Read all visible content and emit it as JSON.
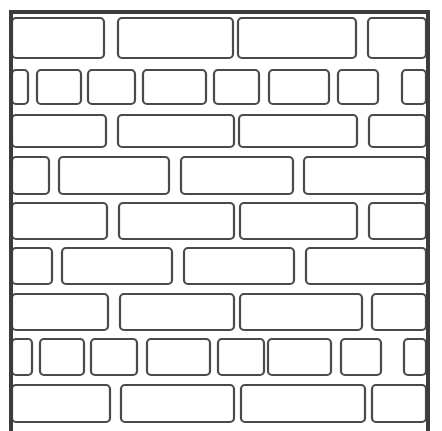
{
  "colors": {
    "background": "#ffffff",
    "outline": "#4a4a4a",
    "frame": "#3c3c3c"
  },
  "frame": {
    "left": 11,
    "top": 12,
    "right": 428,
    "bottom": 431
  },
  "rows": [
    {
      "name": "row-1",
      "y": 18,
      "h": 40,
      "bricks": [
        [
          12,
          92
        ],
        [
          118,
          115
        ],
        [
          238,
          118
        ],
        [
          368,
          58
        ]
      ]
    },
    {
      "name": "row-2",
      "y": 70,
      "h": 34,
      "bricks": [
        [
          12,
          16
        ],
        [
          37,
          44
        ],
        [
          88,
          47
        ],
        [
          143,
          63
        ],
        [
          214,
          45
        ],
        [
          269,
          60
        ],
        [
          338,
          40
        ],
        [
          402,
          24
        ]
      ]
    },
    {
      "name": "row-3",
      "y": 115,
      "h": 32,
      "bricks": [
        [
          12,
          94
        ],
        [
          118,
          116
        ],
        [
          239,
          118
        ],
        [
          369,
          57
        ]
      ]
    },
    {
      "name": "row-4",
      "y": 157,
      "h": 37,
      "bricks": [
        [
          12,
          37
        ],
        [
          59,
          110
        ],
        [
          181,
          112
        ],
        [
          304,
          122
        ]
      ]
    },
    {
      "name": "row-5",
      "y": 203,
      "h": 36,
      "bricks": [
        [
          12,
          95
        ],
        [
          119,
          115
        ],
        [
          240,
          117
        ],
        [
          369,
          57
        ]
      ]
    },
    {
      "name": "row-6",
      "y": 248,
      "h": 36,
      "bricks": [
        [
          12,
          40
        ],
        [
          62,
          110
        ],
        [
          184,
          110
        ],
        [
          306,
          120
        ]
      ]
    },
    {
      "name": "row-7",
      "y": 294,
      "h": 36,
      "bricks": [
        [
          12,
          96
        ],
        [
          120,
          114
        ],
        [
          240,
          122
        ],
        [
          372,
          54
        ]
      ]
    },
    {
      "name": "row-8",
      "y": 339,
      "h": 36,
      "bricks": [
        [
          12,
          20
        ],
        [
          40,
          44
        ],
        [
          91,
          46
        ],
        [
          147,
          63
        ],
        [
          218,
          46
        ],
        [
          268,
          63
        ],
        [
          341,
          40
        ],
        [
          404,
          22
        ]
      ]
    },
    {
      "name": "row-9",
      "y": 385,
      "h": 37,
      "bricks": [
        [
          12,
          98
        ],
        [
          121,
          113
        ],
        [
          241,
          124
        ],
        [
          372,
          54
        ]
      ]
    }
  ]
}
